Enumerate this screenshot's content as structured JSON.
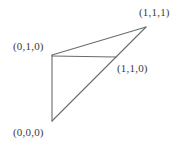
{
  "figure": {
    "background_color": "#ffffff",
    "line_color": "#6b6b6b",
    "text_color": "#3a3a3a",
    "width": 180,
    "height": 146,
    "labels": {
      "top_right": "(1,1,1)",
      "upper_left": "(0,1,0)",
      "middle_right": "(1,1,0)",
      "bottom_left": "(0,0,0)"
    },
    "vertices": [
      {
        "name": "origin",
        "label": "(0,0,0)",
        "x": 52,
        "y": 121
      },
      {
        "name": "upper-left",
        "label": "(0,1,0)",
        "x": 52,
        "y": 55
      },
      {
        "name": "apex",
        "label": "(1,1,1)",
        "x": 146,
        "y": 27
      },
      {
        "name": "mid-edge",
        "label": "(1,1,0)",
        "x": 116,
        "y": 57
      }
    ],
    "edges": [
      {
        "name": "vertical-edge",
        "from": "(0,1,0)",
        "to": "(0,0,0)"
      },
      {
        "name": "horizontal-edge",
        "from": "(0,1,0)",
        "to": "(1,1,0)"
      },
      {
        "name": "upper-diagonal-edge",
        "from": "(0,1,0)",
        "to": "(1,1,1)"
      },
      {
        "name": "lower-diagonal-edge",
        "from": "(0,0,0)",
        "to": "(1,1,1)"
      }
    ]
  }
}
